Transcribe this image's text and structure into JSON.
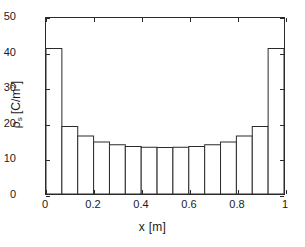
{
  "figure": {
    "background_color": "#ffffff",
    "line_color": "#2b2b2b",
    "bar_face_color": "#ffffff"
  },
  "axes": {
    "x_title": "x [m]",
    "y_title_base": "ρ",
    "y_title_sub": "s",
    "y_title_unit_open": " [C/m",
    "y_title_exp": "2",
    "y_title_unit_close": "]",
    "x_ticks": [
      "0",
      "0.2",
      "0.4",
      "0.6",
      "0.8",
      "1"
    ],
    "x_tick_values": [
      0,
      0.2,
      0.4,
      0.6,
      0.8,
      1
    ],
    "y_ticks": [
      "0",
      "10",
      "20",
      "30",
      "40",
      "50"
    ],
    "y_tick_values": [
      0,
      10,
      20,
      30,
      40,
      50
    ]
  },
  "chart_data": {
    "type": "bar",
    "title": "",
    "subtitle": "",
    "xlabel": "x [m]",
    "ylabel": "ρs [C/m^2]",
    "xlim": [
      0,
      1
    ],
    "ylim": [
      0,
      50
    ],
    "grid": false,
    "legend": null,
    "legend_position": "none",
    "bar_count": 15,
    "bar_width": 0.06667,
    "bar_edge_color": "#2b2b2b",
    "bar_fill_color": "#ffffff",
    "categories": [
      "0.000-0.067",
      "0.067-0.133",
      "0.133-0.200",
      "0.200-0.267",
      "0.267-0.333",
      "0.333-0.400",
      "0.400-0.467",
      "0.467-0.533",
      "0.533-0.600",
      "0.600-0.667",
      "0.667-0.733",
      "0.733-0.800",
      "0.800-0.867",
      "0.867-0.933",
      "0.933-1.000"
    ],
    "bin_edges": [
      0.0,
      0.0667,
      0.1333,
      0.2,
      0.2667,
      0.3333,
      0.4,
      0.4667,
      0.5333,
      0.6,
      0.6667,
      0.7333,
      0.8,
      0.8667,
      0.9333,
      1.0
    ],
    "x_centers": [
      0.0333,
      0.1,
      0.1667,
      0.2333,
      0.3,
      0.3667,
      0.4333,
      0.5,
      0.5667,
      0.6333,
      0.7,
      0.7667,
      0.8333,
      0.9,
      0.9667
    ],
    "values": [
      41.3,
      19.2,
      16.5,
      14.8,
      14.0,
      13.5,
      13.3,
      13.2,
      13.3,
      13.5,
      14.0,
      14.8,
      16.5,
      19.2,
      41.3
    ],
    "annotations": []
  }
}
